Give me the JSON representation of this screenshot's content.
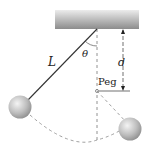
{
  "diagram": {
    "labels": {
      "length": "L",
      "angle": "θ",
      "distance": "d",
      "peg": "Peg"
    },
    "colors": {
      "ceiling_light": "#e0e0e0",
      "ceiling_dark": "#8a8a8a",
      "ball": "#c8c8c8",
      "line": "#333333",
      "dashed": "#777777"
    }
  }
}
